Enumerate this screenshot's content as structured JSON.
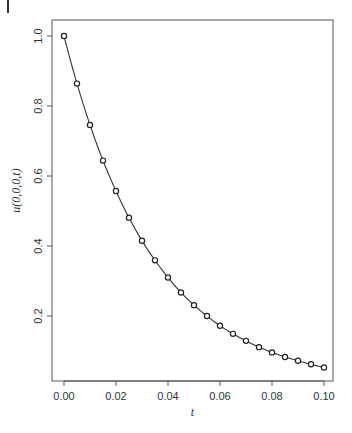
{
  "chart_data": {
    "type": "line",
    "title": "",
    "xlabel": "t",
    "ylabel": "u(0,0,0,t)",
    "xlim": [
      -0.0025,
      0.1035
    ],
    "ylim": [
      0.014,
      1.046
    ],
    "grid": false,
    "legend": null,
    "x_ticks": [
      0.0,
      0.02,
      0.04,
      0.06,
      0.08,
      0.1
    ],
    "x_tick_labels": [
      "0.00",
      "0.02",
      "0.04",
      "0.06",
      "0.08",
      "0.10"
    ],
    "y_ticks": [
      0.2,
      0.4,
      0.6,
      0.8,
      1.0
    ],
    "y_tick_labels": [
      "0.2",
      "0.4",
      "0.6",
      "0.8",
      "1.0"
    ],
    "series": [
      {
        "name": "exact solution (line)",
        "style": "solid-line",
        "x": [
          0,
          0.005,
          0.01,
          0.015,
          0.02,
          0.025,
          0.03,
          0.035,
          0.04,
          0.045,
          0.05,
          0.055,
          0.06,
          0.065,
          0.07,
          0.075,
          0.08,
          0.085,
          0.09,
          0.095,
          0.1
        ],
        "values": [
          1.0,
          0.864,
          0.746,
          0.644,
          0.557,
          0.481,
          0.415,
          0.359,
          0.31,
          0.267,
          0.231,
          0.2,
          0.172,
          0.149,
          0.129,
          0.111,
          0.096,
          0.083,
          0.072,
          0.062,
          0.053
        ]
      },
      {
        "name": "numerical solution (circles)",
        "style": "open-circle-markers",
        "x": [
          0,
          0.005,
          0.01,
          0.015,
          0.02,
          0.025,
          0.03,
          0.035,
          0.04,
          0.045,
          0.05,
          0.055,
          0.06,
          0.065,
          0.07,
          0.075,
          0.08,
          0.085,
          0.09,
          0.095,
          0.1
        ],
        "values": [
          1.0,
          0.864,
          0.746,
          0.644,
          0.557,
          0.481,
          0.415,
          0.359,
          0.31,
          0.267,
          0.231,
          0.2,
          0.172,
          0.149,
          0.129,
          0.111,
          0.096,
          0.083,
          0.072,
          0.062,
          0.053
        ]
      }
    ]
  },
  "layout": {
    "plot_box": {
      "left": 52,
      "top": 20,
      "right": 333,
      "bottom": 381
    },
    "x_px": {
      "t0": 64,
      "per_unit": 2600
    },
    "y_px": {
      "u1": 36,
      "per_unit": 350
    }
  },
  "colors": {
    "line": "#333333",
    "marker": "#222222",
    "axis": "#555555"
  },
  "caption": ""
}
